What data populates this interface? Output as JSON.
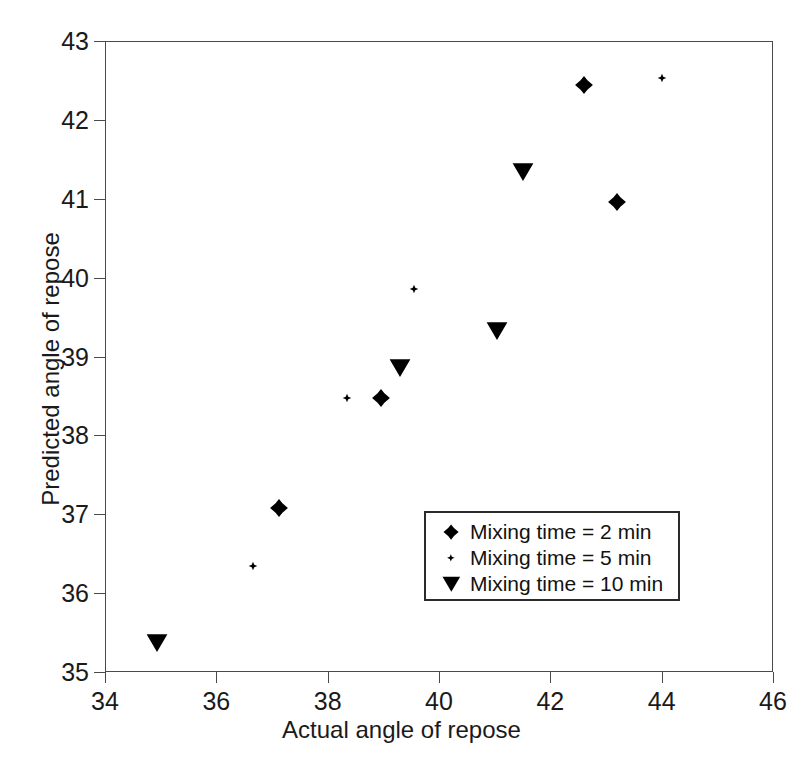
{
  "chart_data": {
    "type": "scatter",
    "title": "",
    "xlabel": "Actual angle of repose",
    "ylabel": "Predicted angle of repose",
    "xlim": [
      34,
      46
    ],
    "ylim": [
      35,
      43
    ],
    "xticks": [
      34,
      36,
      38,
      40,
      42,
      44,
      46
    ],
    "yticks": [
      35,
      36,
      37,
      38,
      39,
      40,
      41,
      42,
      43
    ],
    "xticklabels": [
      "34",
      "36",
      "38",
      "40",
      "42",
      "44",
      "46"
    ],
    "yticklabels": [
      "35",
      "36",
      "37",
      "38",
      "39",
      "40",
      "41",
      "42",
      "43"
    ],
    "grid": false,
    "legend_position": "lower-right-inside",
    "series": [
      {
        "name": "Mixing time = 2 min",
        "marker": "filled-diamond",
        "marker_size": "large",
        "color": "#000000",
        "points": [
          {
            "x": 37.13,
            "y": 37.08
          },
          {
            "x": 38.95,
            "y": 38.47
          },
          {
            "x": 42.6,
            "y": 42.44
          },
          {
            "x": 43.2,
            "y": 40.96
          }
        ]
      },
      {
        "name": "Mixing time = 5 min",
        "marker": "small-dot",
        "marker_size": "small",
        "color": "#000000",
        "points": [
          {
            "x": 36.65,
            "y": 36.35
          },
          {
            "x": 38.35,
            "y": 38.48
          },
          {
            "x": 39.55,
            "y": 39.86
          },
          {
            "x": 44.0,
            "y": 42.53
          }
        ]
      },
      {
        "name": "Mixing time = 10 min",
        "marker": "filled-down-triangle",
        "marker_size": "medium",
        "color": "#000000",
        "points": [
          {
            "x": 34.93,
            "y": 35.37
          },
          {
            "x": 39.3,
            "y": 38.86
          },
          {
            "x": 41.05,
            "y": 39.32
          },
          {
            "x": 41.5,
            "y": 41.34
          }
        ]
      }
    ]
  },
  "legend": {
    "entries": [
      {
        "label": "Mixing time = 2 min",
        "marker": "filled-diamond"
      },
      {
        "label": "Mixing time = 5 min",
        "marker": "small-dot"
      },
      {
        "label": "Mixing time = 10 min",
        "marker": "filled-down-triangle"
      }
    ]
  },
  "colors": {
    "marker": "#000000",
    "axis": "#4a4a4a",
    "text": "#1a1a1a",
    "legend_border": "#2b2b2b",
    "background": "#ffffff"
  }
}
